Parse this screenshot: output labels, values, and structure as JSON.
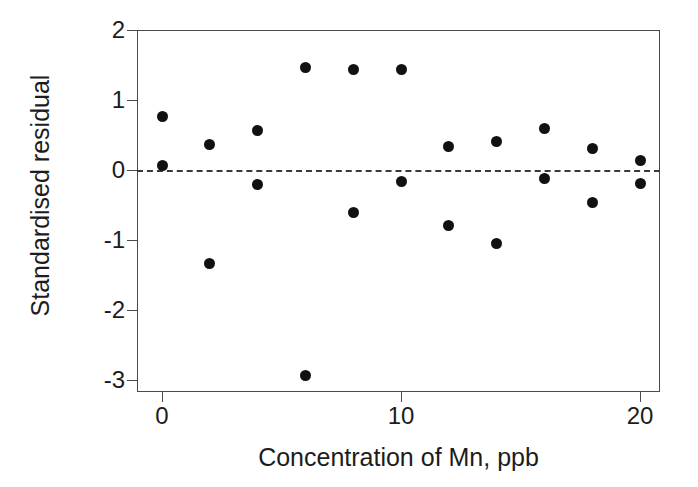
{
  "chart_data": {
    "type": "scatter",
    "title": "",
    "xlabel": "Concentration of Mn, ppb",
    "ylabel": "Standardised residual",
    "xlim": [
      -1.05,
      21.0
    ],
    "ylim": [
      -3.17,
      2.0
    ],
    "xticks": [
      0,
      10,
      20
    ],
    "xticklabels": [
      "0",
      "10",
      "20"
    ],
    "yticks": [
      2,
      1,
      0,
      -1,
      -2,
      -3
    ],
    "yticklabels": [
      "2",
      "1",
      "0",
      "-1",
      "-2",
      "-3"
    ],
    "grid": false,
    "legend": null,
    "reference_line": {
      "type": "horizontal",
      "y": 0,
      "style": "dashed",
      "color": "#3a3a3a"
    },
    "marker": {
      "shape": "circle",
      "filled": true,
      "color": "#111111",
      "size": 11
    },
    "x": [
      0,
      0,
      2,
      2,
      4,
      4,
      6,
      6,
      8,
      8,
      10,
      10,
      12,
      12,
      14,
      14,
      16,
      16,
      18,
      18,
      20,
      20
    ],
    "y": [
      0.07,
      0.77,
      0.36,
      -1.33,
      0.56,
      -0.21,
      1.47,
      -2.94,
      1.44,
      -0.6,
      1.44,
      -0.16,
      0.33,
      -0.79,
      0.41,
      -1.05,
      0.6,
      -0.12,
      0.31,
      -0.46,
      0.13,
      -0.19
    ],
    "points": [
      {
        "x": 0,
        "y": 0.07
      },
      {
        "x": 0,
        "y": 0.77
      },
      {
        "x": 2,
        "y": 0.36
      },
      {
        "x": 2,
        "y": -1.33
      },
      {
        "x": 4,
        "y": 0.56
      },
      {
        "x": 4,
        "y": -0.21
      },
      {
        "x": 6,
        "y": 1.47
      },
      {
        "x": 6,
        "y": -2.94
      },
      {
        "x": 8,
        "y": 1.44
      },
      {
        "x": 8,
        "y": -0.6
      },
      {
        "x": 10,
        "y": 1.44
      },
      {
        "x": 10,
        "y": -0.16
      },
      {
        "x": 12,
        "y": 0.33
      },
      {
        "x": 12,
        "y": -0.79
      },
      {
        "x": 14,
        "y": 0.41
      },
      {
        "x": 14,
        "y": -1.05
      },
      {
        "x": 16,
        "y": 0.6
      },
      {
        "x": 16,
        "y": -0.12
      },
      {
        "x": 18,
        "y": 0.31
      },
      {
        "x": 18,
        "y": -0.46
      },
      {
        "x": 20,
        "y": 0.13
      },
      {
        "x": 20,
        "y": -0.19
      }
    ]
  }
}
